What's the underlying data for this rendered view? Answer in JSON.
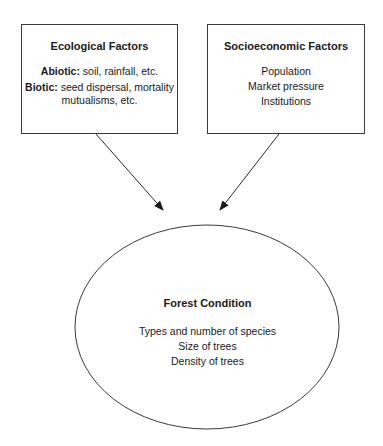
{
  "ecological": {
    "title": "Ecological Factors",
    "abiotic_label": "Abiotic:",
    "abiotic_text": " soil, rainfall, etc.",
    "biotic_label": "Biotic:",
    "biotic_text": " seed dispersal, mortality",
    "biotic_text2": "mutualisms, etc."
  },
  "socioeconomic": {
    "title": "Socioeconomic Factors",
    "items": [
      "Population",
      "Market pressure",
      "Institutions"
    ]
  },
  "forest": {
    "title": "Forest Condition",
    "items": [
      "Types and number of species",
      "Size of trees",
      "Density of trees"
    ]
  },
  "colors": {
    "stroke": "#3a3a3a",
    "text": "#1a1a1a",
    "background": "#ffffff"
  }
}
